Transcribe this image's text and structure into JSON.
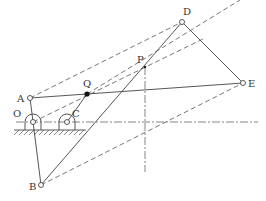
{
  "diagram": {
    "type": "linkage-mechanism",
    "points": {
      "A": {
        "label": "A",
        "x": 30,
        "y": 98
      },
      "O": {
        "label": "O",
        "x": 33,
        "y": 122
      },
      "C": {
        "label": "C",
        "x": 67,
        "y": 122
      },
      "Q": {
        "label": "Q",
        "x": 87,
        "y": 94
      },
      "P": {
        "label": "P",
        "x": 145,
        "y": 67
      },
      "D": {
        "label": "D",
        "x": 182,
        "y": 22
      },
      "E": {
        "label": "E",
        "x": 243,
        "y": 83
      },
      "B": {
        "label": "B",
        "x": 41,
        "y": 185
      }
    },
    "solid_links": [
      [
        "A",
        "E"
      ],
      [
        "B",
        "D"
      ],
      [
        "D",
        "E"
      ],
      [
        "O",
        "B"
      ],
      [
        "C",
        "Q"
      ],
      [
        "A",
        "O"
      ]
    ],
    "dashed_links": [
      [
        "A",
        "D"
      ],
      [
        "O",
        "P"
      ],
      [
        "B",
        "E"
      ],
      [
        "Q",
        "E"
      ]
    ],
    "centerlines": {
      "horizontal": {
        "y": 122,
        "x1": 16,
        "x2": 258
      },
      "vertical": {
        "x": 145,
        "y1": 67,
        "y2": 172
      }
    },
    "ground": {
      "x1": 14,
      "x2": 86,
      "y": 130
    }
  }
}
